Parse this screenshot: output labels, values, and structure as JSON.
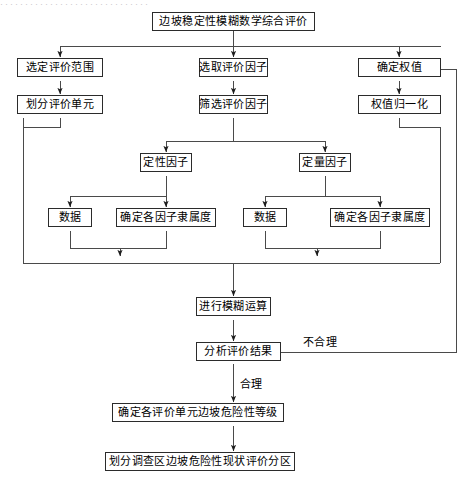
{
  "figure": {
    "type": "flowchart",
    "orientation": "top-to-bottom",
    "header_artifact": "······························",
    "line_color": "#2b2b2b",
    "text_color": "#000000",
    "background": "#ffffff"
  },
  "nodes": {
    "title": "边坡稳定性模糊数学综合评价",
    "scope": "选定评价范围",
    "factors_select": "选取评价因子",
    "weights": "确定权值",
    "units": "划分评价单元",
    "factors_filter": "筛选评价因子",
    "weights_norm": "权值归一化",
    "qualitative": "定性因子",
    "quantitative": "定量因子",
    "data_qual": "数据",
    "membership_qual": "确定各因子隶属度",
    "data_quant": "数据",
    "membership_quant": "确定各因子隶属度",
    "fuzzy_operation": "进行模糊运算",
    "analyze_result": "分析评价结果",
    "risk_level": "确定各评价单元边坡危险性等级",
    "zoning": "划分调查区边坡危险性现状评价分区"
  },
  "edge_labels": {
    "unreasonable": "不合理",
    "reasonable": "合理"
  }
}
